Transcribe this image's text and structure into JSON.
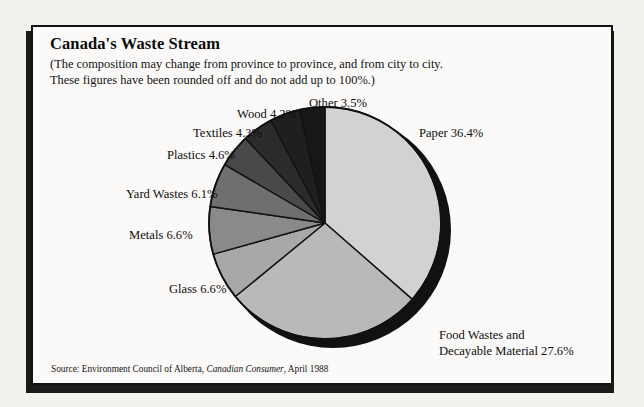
{
  "panel": {
    "title": "Canada's Waste Stream",
    "subtitle_line1": "(The composition may change from province to province, and from city to city.",
    "subtitle_line2": "These figures have been rounded off and do not add up to 100%.)",
    "source_prefix": "Source:  Environment Council of Alberta,",
    "source_publication": "Canadian Consumer",
    "source_suffix": ", April 1988"
  },
  "labels": {
    "other": "Other 3.5%",
    "paper": "Paper 36.4%",
    "wood": "Wood 4.2%",
    "textiles": "Textiles 4.3%",
    "plastics": "Plastics 4.6%",
    "yard_wastes": "Yard Wastes 6.1%",
    "metals": "Metals 6.6%",
    "glass": "Glass 6.6%",
    "food_line1": "Food Wastes and",
    "food_line2": "Decayable Material 27.6%"
  },
  "chart_data": {
    "type": "pie",
    "title": "Canada's Waste Stream",
    "subtitle": "(The composition may change from province to province, and from city to city. These figures have been rounded off and do not add up to 100%.)",
    "units": "percent",
    "total": 100.0,
    "sum_of_slices": 99.9,
    "start_angle_deg": 0,
    "direction": "clockwise",
    "legend": "none-inline-labels",
    "three_d": true,
    "categories": [
      "Paper",
      "Food Wastes and Decayable Material",
      "Glass",
      "Metals",
      "Yard Wastes",
      "Plastics",
      "Textiles",
      "Wood",
      "Other"
    ],
    "values": [
      36.4,
      27.6,
      6.6,
      6.6,
      6.1,
      4.6,
      4.3,
      4.2,
      3.5
    ],
    "slices": [
      {
        "label": "Paper 36.4%",
        "name": "Paper",
        "value": 36.4,
        "color": "#d2d2d2"
      },
      {
        "label": "Decayable Material 27.6%",
        "name": "Food Wastes and Decayable Material",
        "value": 27.6,
        "color": "#b9b9b9"
      },
      {
        "label": "Glass 6.6%",
        "name": "Glass",
        "value": 6.6,
        "color": "#a8a8a8"
      },
      {
        "label": "Metals 6.6%",
        "name": "Metals",
        "value": 6.6,
        "color": "#8a8a8a"
      },
      {
        "label": "Yard Wastes 6.1%",
        "name": "Yard Wastes",
        "value": 6.1,
        "color": "#6f6f6f"
      },
      {
        "label": "Plastics 4.6%",
        "name": "Plastics",
        "value": 4.6,
        "color": "#494949"
      },
      {
        "label": "Textiles 4.3%",
        "name": "Textiles",
        "value": 4.3,
        "color": "#2b2b2b"
      },
      {
        "label": "Wood 4.2%",
        "name": "Wood",
        "value": 4.2,
        "color": "#1f1f1f"
      },
      {
        "label": "Other 3.5%",
        "name": "Other",
        "value": 3.5,
        "color": "#171717"
      }
    ],
    "source": "Source:  Environment Council of Alberta, Canadian Consumer, April 1988"
  },
  "colors": {
    "page_background": "#f2f1ee",
    "panel_background": "#fbfaf8",
    "border": "#121212",
    "shadow": "#1a1a1a",
    "rim": "#111111",
    "text": "#0d0d0d"
  }
}
